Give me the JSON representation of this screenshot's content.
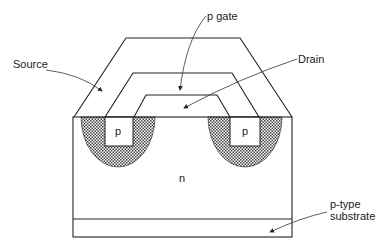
{
  "diagram": {
    "labels": {
      "source": "Source",
      "gate": "p gate",
      "drain": "Drain",
      "p_left": "p",
      "p_right": "p",
      "n_region": "n",
      "substrate_line1": "p-type",
      "substrate_line2": "substrate"
    },
    "colors": {
      "line": "#222222",
      "hatch": "#555555",
      "background": "#ffffff"
    }
  }
}
